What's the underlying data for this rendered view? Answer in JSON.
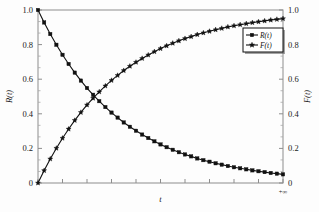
{
  "chart_data": {
    "type": "line",
    "title": "",
    "xlabel": "t",
    "ylabel": "R(t)",
    "ylabel_right": "F(t)",
    "xlim": [
      0,
      1
    ],
    "ylim": [
      0,
      1
    ],
    "grid": false,
    "legend_position": "upper-right",
    "x_tick_labels": [
      "",
      "+∞"
    ],
    "y_tick_labels": [
      "0",
      "0.2",
      "0.4",
      "0.6",
      "0.8",
      "1.0"
    ],
    "y_tick_values": [
      0,
      0.2,
      0.4,
      0.6,
      0.8,
      1.0
    ],
    "y_tick_labels_right": [
      "0",
      "0.2",
      "0.4",
      "0.6",
      "0.8",
      "1.0"
    ],
    "x_major_tick_count": 10,
    "y_minor_per_major": 2,
    "x_end_label": "+∞",
    "series": [
      {
        "name": "R(t)",
        "marker": "square",
        "color": "#111111",
        "x": [
          0.0,
          0.025,
          0.05,
          0.075,
          0.1,
          0.125,
          0.15,
          0.175,
          0.2,
          0.225,
          0.25,
          0.275,
          0.3,
          0.325,
          0.35,
          0.375,
          0.4,
          0.425,
          0.45,
          0.475,
          0.5,
          0.525,
          0.55,
          0.575,
          0.6,
          0.625,
          0.65,
          0.675,
          0.7,
          0.725,
          0.75,
          0.775,
          0.8,
          0.825,
          0.85,
          0.875,
          0.9,
          0.925,
          0.95,
          0.975,
          1.0
        ],
        "values": [
          1.0,
          0.928,
          0.861,
          0.799,
          0.741,
          0.688,
          0.638,
          0.592,
          0.549,
          0.51,
          0.473,
          0.439,
          0.407,
          0.378,
          0.35,
          0.325,
          0.302,
          0.28,
          0.26,
          0.241,
          0.223,
          0.207,
          0.192,
          0.178,
          0.165,
          0.154,
          0.142,
          0.132,
          0.123,
          0.114,
          0.106,
          0.098,
          0.091,
          0.085,
          0.079,
          0.073,
          0.068,
          0.063,
          0.058,
          0.054,
          0.05
        ]
      },
      {
        "name": "F(t)",
        "marker": "star",
        "color": "#111111",
        "x": [
          0.0,
          0.025,
          0.05,
          0.075,
          0.1,
          0.125,
          0.15,
          0.175,
          0.2,
          0.225,
          0.25,
          0.275,
          0.3,
          0.325,
          0.35,
          0.375,
          0.4,
          0.425,
          0.45,
          0.475,
          0.5,
          0.525,
          0.55,
          0.575,
          0.6,
          0.625,
          0.65,
          0.675,
          0.7,
          0.725,
          0.75,
          0.775,
          0.8,
          0.825,
          0.85,
          0.875,
          0.9,
          0.925,
          0.95,
          0.975,
          1.0
        ],
        "values": [
          0.0,
          0.072,
          0.139,
          0.201,
          0.259,
          0.312,
          0.362,
          0.408,
          0.451,
          0.49,
          0.527,
          0.561,
          0.593,
          0.622,
          0.65,
          0.675,
          0.698,
          0.72,
          0.74,
          0.759,
          0.777,
          0.793,
          0.808,
          0.822,
          0.835,
          0.846,
          0.858,
          0.868,
          0.877,
          0.886,
          0.894,
          0.902,
          0.909,
          0.915,
          0.921,
          0.927,
          0.932,
          0.937,
          0.942,
          0.946,
          0.95
        ]
      }
    ],
    "annotations": {
      "crossing_value": 0.5
    }
  },
  "legend": {
    "entries": [
      {
        "label": "R(t)",
        "marker": "square"
      },
      {
        "label": "F(t)",
        "marker": "star"
      }
    ]
  },
  "colors": {
    "curve": "#111111",
    "axis": "#8d8d8d",
    "background": "#fdfdfd",
    "text": "#1a1a1a"
  }
}
